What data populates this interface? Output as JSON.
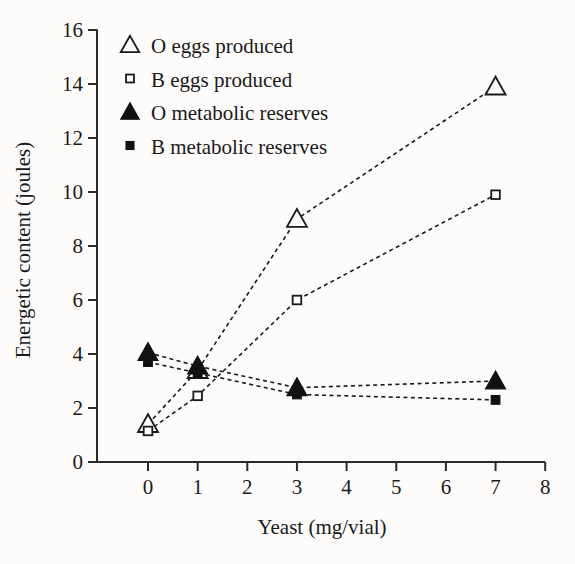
{
  "chart_data": {
    "type": "line",
    "title": "",
    "xlabel": "Yeast (mg/vial)",
    "ylabel": "Energetic content (joules)",
    "x": [
      0,
      1,
      3,
      7
    ],
    "xlim": [
      0,
      8
    ],
    "ylim": [
      0,
      16
    ],
    "xticks": [
      0,
      1,
      2,
      3,
      4,
      5,
      6,
      7,
      8
    ],
    "yticks": [
      0,
      2,
      4,
      6,
      8,
      10,
      12,
      14,
      16
    ],
    "grid": false,
    "legend_position": "top-left",
    "series": [
      {
        "name": "O eggs produced",
        "marker": "open-triangle",
        "values": [
          1.4,
          3.4,
          9.0,
          13.9
        ]
      },
      {
        "name": "B eggs produced",
        "marker": "open-square",
        "values": [
          1.15,
          2.45,
          6.0,
          9.9
        ]
      },
      {
        "name": "O metabolic reserves",
        "marker": "filled-triangle",
        "values": [
          4.05,
          3.55,
          2.75,
          3.0
        ]
      },
      {
        "name": "B metabolic reserves",
        "marker": "filled-square",
        "values": [
          3.7,
          3.3,
          2.5,
          2.3
        ]
      }
    ]
  },
  "axes": {
    "x_tick_labels": [
      "0",
      "1",
      "2",
      "3",
      "4",
      "5",
      "6",
      "7",
      "8"
    ],
    "y_tick_labels": [
      "0",
      "2",
      "4",
      "6",
      "8",
      "10",
      "12",
      "14",
      "16"
    ],
    "x_title": "Yeast (mg/vial)",
    "y_title": "Energetic content (joules)"
  },
  "legend": {
    "items": [
      {
        "label": "O eggs produced",
        "marker": "open-triangle"
      },
      {
        "label": "B eggs produced",
        "marker": "open-square"
      },
      {
        "label": "O metabolic reserves",
        "marker": "filled-triangle"
      },
      {
        "label": "B metabolic reserves",
        "marker": "filled-square"
      }
    ]
  },
  "style": {
    "line_color": "#1a1a1a",
    "marker_fill_open": "#fdfcfa",
    "marker_fill_solid": "#111111",
    "background": "#fdfcfa"
  }
}
